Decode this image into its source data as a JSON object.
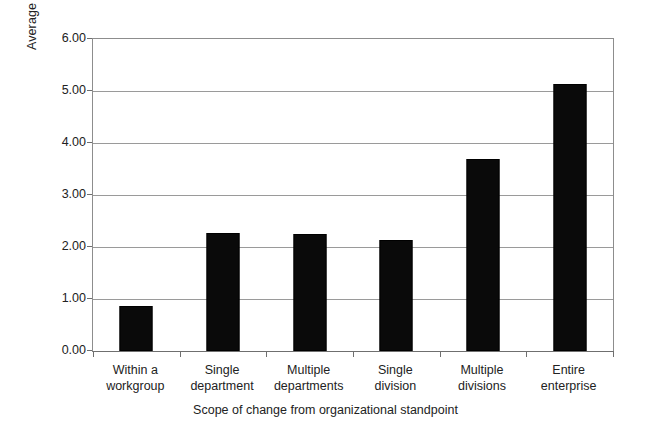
{
  "chart_data": {
    "type": "bar",
    "title": "",
    "xlabel": "Scope of change from organizational standpoint",
    "ylabel": "Average FTE dedicated to change management",
    "categories": [
      "Within a workgroup",
      "Single department",
      "Multiple departments",
      "Single division",
      "Multiple divisions",
      "Entire enterprise"
    ],
    "category_lines": [
      [
        "Within a",
        "workgroup"
      ],
      [
        "Single",
        "department"
      ],
      [
        "Multiple",
        "departments"
      ],
      [
        "Single",
        "division"
      ],
      [
        "Multiple",
        "divisions"
      ],
      [
        "Entire",
        "enterprise"
      ]
    ],
    "values": [
      0.87,
      2.27,
      2.25,
      2.13,
      3.7,
      5.13
    ],
    "ylim": [
      0.0,
      6.0
    ],
    "ytick_labels": [
      "0.00",
      "1.00",
      "2.00",
      "3.00",
      "4.00",
      "5.00",
      "6.00"
    ],
    "ytick_values": [
      0,
      1,
      2,
      3,
      4,
      5,
      6
    ],
    "grid": "horizontal",
    "legend": "none",
    "bar_color": "#0a0a0a"
  },
  "axis": {
    "y_title": "Average FTE dedicated to change management",
    "x_title": "Scope of change from organizational standpoint"
  }
}
